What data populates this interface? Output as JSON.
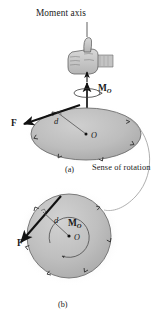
{
  "figure": {
    "title": "Moment axis",
    "caption_a": "(a)",
    "caption_b": "(b)",
    "sense_label": "Sense of rotation",
    "colors": {
      "ink": "#1a1a1a",
      "disc_fill": "#b9b9b9",
      "disc_edge": "#6e6e6e",
      "shadow": "#d6d6d6",
      "hand_fill": "#c7c7c7",
      "hand_line": "#4a4a4a",
      "thin_line": "#8a8a8a",
      "background": "#ffffff"
    },
    "panel_a": {
      "name": "perspective-view",
      "moment_label": "M",
      "moment_subscript": "O",
      "force_label": "F",
      "distance_label": "d",
      "origin_label": "O",
      "icon": "thumbs-up-hand-icon"
    },
    "panel_b": {
      "name": "plan-view",
      "moment_label": "M",
      "moment_subscript": "O",
      "force_label": "F",
      "distance_label": "d",
      "origin_label": "O"
    }
  }
}
